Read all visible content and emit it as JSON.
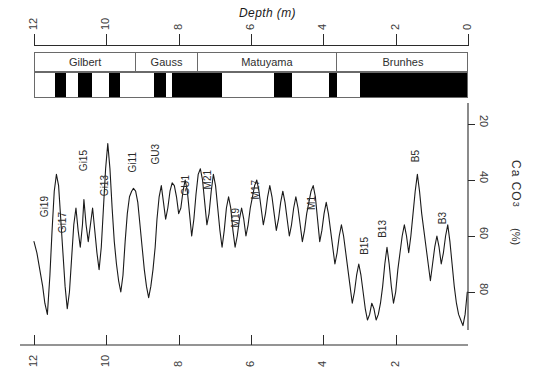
{
  "figure": {
    "top_axis_title": "Depth  (m)",
    "y_axis_title_main": "Ca CO",
    "y_axis_title_sub": "3",
    "y_axis_title_units": "(%)"
  },
  "top_axis": {
    "ticks": [
      {
        "value": 12,
        "label": "12"
      },
      {
        "value": 10,
        "label": "10"
      },
      {
        "value": 8,
        "label": "8"
      },
      {
        "value": 6,
        "label": "6"
      },
      {
        "value": 4,
        "label": "4"
      },
      {
        "value": 2,
        "label": "2"
      },
      {
        "value": 0,
        "label": "0"
      }
    ]
  },
  "bottom_axis": {
    "ticks": [
      {
        "value": 12,
        "label": "12"
      },
      {
        "value": 10,
        "label": "10"
      },
      {
        "value": 8,
        "label": "8"
      },
      {
        "value": 6,
        "label": "6"
      },
      {
        "value": 4,
        "label": "4"
      },
      {
        "value": 2,
        "label": "2"
      }
    ]
  },
  "right_axis": {
    "ticks": [
      {
        "value": 20,
        "label": "20"
      },
      {
        "value": 40,
        "label": "40"
      },
      {
        "value": 60,
        "label": "60"
      },
      {
        "value": 80,
        "label": "80"
      }
    ]
  },
  "magnetostratigraphy": {
    "chrons": [
      {
        "name": "Gilbert",
        "start_depth": 12.0,
        "end_depth": 9.2
      },
      {
        "name": "Gauss",
        "start_depth": 9.2,
        "end_depth": 7.5
      },
      {
        "name": "Matuyama",
        "start_depth": 7.5,
        "end_depth": 3.65
      },
      {
        "name": "Brunhes",
        "start_depth": 3.65,
        "end_depth": 0.0
      }
    ],
    "polarity_bands": [
      {
        "polarity": "normal",
        "start_depth": 12.0,
        "end_depth": 11.45,
        "color": "#ffffff"
      },
      {
        "polarity": "reversed",
        "start_depth": 11.45,
        "end_depth": 11.15,
        "color": "#000000"
      },
      {
        "polarity": "normal",
        "start_depth": 11.15,
        "end_depth": 10.8,
        "color": "#ffffff"
      },
      {
        "polarity": "reversed",
        "start_depth": 10.8,
        "end_depth": 10.43,
        "color": "#000000"
      },
      {
        "polarity": "normal",
        "start_depth": 10.43,
        "end_depth": 9.95,
        "color": "#ffffff"
      },
      {
        "polarity": "reversed",
        "start_depth": 9.95,
        "end_depth": 9.65,
        "color": "#000000"
      },
      {
        "polarity": "normal",
        "start_depth": 9.65,
        "end_depth": 8.7,
        "color": "#ffffff"
      },
      {
        "polarity": "reversed",
        "start_depth": 8.7,
        "end_depth": 8.37,
        "color": "#000000"
      },
      {
        "polarity": "normal",
        "start_depth": 8.37,
        "end_depth": 8.2,
        "color": "#ffffff"
      },
      {
        "polarity": "reversed",
        "start_depth": 8.2,
        "end_depth": 6.82,
        "color": "#000000"
      },
      {
        "polarity": "normal",
        "start_depth": 6.82,
        "end_depth": 5.39,
        "color": "#ffffff"
      },
      {
        "polarity": "reversed",
        "start_depth": 5.39,
        "end_depth": 4.9,
        "color": "#000000"
      },
      {
        "polarity": "normal",
        "start_depth": 4.9,
        "end_depth": 3.88,
        "color": "#ffffff"
      },
      {
        "polarity": "reversed",
        "start_depth": 3.88,
        "end_depth": 3.65,
        "color": "#000000"
      },
      {
        "polarity": "normal",
        "start_depth": 3.65,
        "end_depth": 3.02,
        "color": "#ffffff"
      },
      {
        "polarity": "reversed",
        "start_depth": 3.02,
        "end_depth": 0.0,
        "color": "#000000"
      }
    ]
  },
  "event_labels": [
    {
      "name": "Gi19",
      "depth": 11.7,
      "y_px": 196
    },
    {
      "name": "Gi17",
      "depth": 11.2,
      "y_px": 212
    },
    {
      "name": "Gi15",
      "depth": 10.62,
      "y_px": 150
    },
    {
      "name": "Gi13",
      "depth": 10.05,
      "y_px": 175
    },
    {
      "name": "Gi11",
      "depth": 9.25,
      "y_px": 152
    },
    {
      "name": "GU3",
      "depth": 8.62,
      "y_px": 144
    },
    {
      "name": "GU1",
      "depth": 7.8,
      "y_px": 175
    },
    {
      "name": "M21",
      "depth": 7.2,
      "y_px": 170
    },
    {
      "name": "M19",
      "depth": 6.42,
      "y_px": 208
    },
    {
      "name": "M17",
      "depth": 5.85,
      "y_px": 180
    },
    {
      "name": "M1",
      "depth": 4.32,
      "y_px": 196
    },
    {
      "name": "B15",
      "depth": 2.85,
      "y_px": 237
    },
    {
      "name": "B13",
      "depth": 2.35,
      "y_px": 220
    },
    {
      "name": "B5",
      "depth": 1.45,
      "y_px": 150
    },
    {
      "name": "B3",
      "depth": 0.7,
      "y_px": 212
    }
  ],
  "chart_data": {
    "type": "line",
    "title": "",
    "xlabel": "Depth  (m)",
    "ylabel": "Ca CO3 (%)",
    "xlim": [
      12.0,
      0.0
    ],
    "ylim": [
      95,
      12
    ],
    "grid": false,
    "legend": "none",
    "x_tick_values": [
      12,
      10,
      8,
      6,
      4,
      2,
      0
    ],
    "y_tick_values": [
      20,
      40,
      60,
      80
    ],
    "series": [
      {
        "name": "CaCO3",
        "color": "#1a1a1a",
        "x": [
          12.0,
          11.92,
          11.84,
          11.76,
          11.7,
          11.63,
          11.56,
          11.5,
          11.44,
          11.38,
          11.32,
          11.26,
          11.2,
          11.14,
          11.08,
          11.02,
          10.96,
          10.9,
          10.84,
          10.78,
          10.72,
          10.66,
          10.62,
          10.56,
          10.5,
          10.44,
          10.38,
          10.32,
          10.26,
          10.2,
          10.14,
          10.08,
          10.02,
          9.96,
          9.9,
          9.84,
          9.78,
          9.72,
          9.66,
          9.6,
          9.54,
          9.48,
          9.42,
          9.36,
          9.3,
          9.25,
          9.19,
          9.13,
          9.07,
          9.01,
          8.95,
          8.89,
          8.83,
          8.77,
          8.71,
          8.65,
          8.6,
          8.54,
          8.48,
          8.42,
          8.36,
          8.3,
          8.24,
          8.18,
          8.12,
          8.06,
          8.0,
          7.94,
          7.88,
          7.82,
          7.76,
          7.7,
          7.64,
          7.58,
          7.52,
          7.46,
          7.4,
          7.34,
          7.28,
          7.22,
          7.16,
          7.1,
          7.04,
          6.98,
          6.92,
          6.86,
          6.8,
          6.74,
          6.68,
          6.62,
          6.56,
          6.5,
          6.44,
          6.38,
          6.32,
          6.26,
          6.2,
          6.14,
          6.08,
          6.02,
          5.96,
          5.9,
          5.84,
          5.78,
          5.72,
          5.66,
          5.6,
          5.54,
          5.48,
          5.42,
          5.36,
          5.3,
          5.24,
          5.18,
          5.12,
          5.06,
          5.0,
          4.94,
          4.88,
          4.82,
          4.76,
          4.7,
          4.64,
          4.58,
          4.52,
          4.46,
          4.4,
          4.34,
          4.28,
          4.22,
          4.16,
          4.1,
          4.04,
          3.98,
          3.92,
          3.86,
          3.8,
          3.74,
          3.68,
          3.62,
          3.56,
          3.5,
          3.44,
          3.38,
          3.32,
          3.26,
          3.2,
          3.14,
          3.08,
          3.02,
          2.96,
          2.9,
          2.84,
          2.78,
          2.72,
          2.66,
          2.6,
          2.54,
          2.48,
          2.42,
          2.36,
          2.3,
          2.24,
          2.18,
          2.12,
          2.06,
          2.0,
          1.94,
          1.88,
          1.82,
          1.76,
          1.7,
          1.64,
          1.58,
          1.52,
          1.46,
          1.4,
          1.34,
          1.28,
          1.22,
          1.16,
          1.1,
          1.04,
          0.98,
          0.92,
          0.86,
          0.8,
          0.74,
          0.68,
          0.62,
          0.56,
          0.5,
          0.44,
          0.38,
          0.32,
          0.26,
          0.2,
          0.14,
          0.08,
          0.02
        ],
        "y": [
          62,
          66,
          72,
          78,
          84,
          88,
          74,
          58,
          44,
          38,
          42,
          54,
          66,
          78,
          86,
          80,
          68,
          56,
          50,
          58,
          64,
          56,
          47,
          56,
          62,
          56,
          50,
          58,
          66,
          72,
          64,
          50,
          36,
          27,
          36,
          50,
          62,
          70,
          76,
          80,
          74,
          62,
          52,
          46,
          44,
          43,
          44,
          48,
          56,
          64,
          72,
          78,
          82,
          78,
          72,
          64,
          54,
          46,
          42,
          48,
          54,
          50,
          44,
          41,
          42,
          46,
          52,
          50,
          44,
          40,
          44,
          52,
          60,
          54,
          45,
          38,
          36,
          40,
          48,
          56,
          52,
          44,
          38,
          42,
          50,
          58,
          64,
          58,
          50,
          46,
          50,
          58,
          64,
          60,
          54,
          50,
          54,
          60,
          56,
          50,
          46,
          42,
          40,
          44,
          50,
          56,
          52,
          46,
          42,
          46,
          52,
          58,
          54,
          48,
          44,
          48,
          54,
          60,
          56,
          50,
          46,
          50,
          56,
          62,
          58,
          52,
          48,
          44,
          42,
          46,
          54,
          62,
          58,
          52,
          48,
          52,
          58,
          64,
          70,
          66,
          60,
          56,
          60,
          66,
          72,
          78,
          84,
          80,
          74,
          70,
          74,
          80,
          86,
          90,
          88,
          84,
          86,
          90,
          88,
          84,
          78,
          70,
          64,
          70,
          78,
          84,
          80,
          72,
          66,
          60,
          56,
          60,
          66,
          60,
          52,
          44,
          38,
          44,
          52,
          58,
          64,
          70,
          76,
          70,
          64,
          60,
          64,
          70,
          66,
          60,
          56,
          62,
          70,
          78,
          84,
          88,
          90,
          92,
          88,
          80
        ]
      }
    ]
  }
}
